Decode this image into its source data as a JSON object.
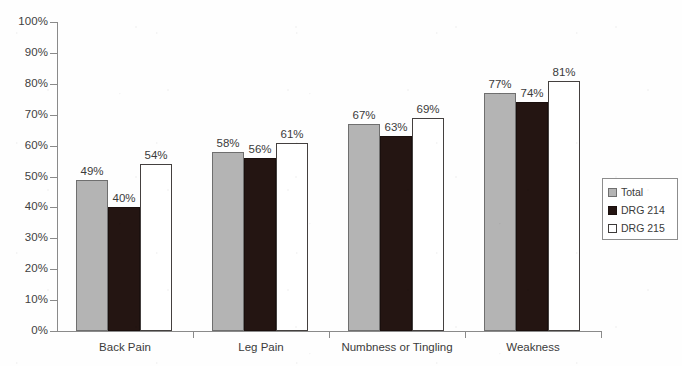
{
  "chart_data": {
    "type": "bar",
    "title": "",
    "subtitle": "",
    "xlabel": "",
    "ylabel": "",
    "ylim": [
      0,
      100
    ],
    "yticks": [
      "0%",
      "10%",
      "20%",
      "30%",
      "40%",
      "50%",
      "60%",
      "70%",
      "80%",
      "90%",
      "100%"
    ],
    "grid": false,
    "legend_position": "right",
    "categories": [
      "Back Pain",
      "Leg Pain",
      "Numbness or Tingling",
      "Weakness"
    ],
    "series": [
      {
        "name": "Total",
        "color": "#b4b4b4",
        "values": [
          49,
          58,
          67,
          77
        ],
        "labels": [
          "49%",
          "58%",
          "67%",
          "77%"
        ]
      },
      {
        "name": "DRG 214",
        "color": "#241512",
        "values": [
          40,
          56,
          63,
          74
        ],
        "labels": [
          "40%",
          "56%",
          "63%",
          "74%"
        ]
      },
      {
        "name": "DRG 215",
        "color": "#ffffff",
        "values": [
          54,
          61,
          69,
          81
        ],
        "labels": [
          "54%",
          "61%",
          "69%",
          "81%"
        ]
      }
    ]
  },
  "legend": {
    "items": [
      {
        "label": "Total",
        "swatch": "total"
      },
      {
        "label": "DRG 214",
        "swatch": "drg214"
      },
      {
        "label": "DRG 215",
        "swatch": "drg215"
      }
    ]
  },
  "axis": {
    "y_labels": [
      "100%",
      "90%",
      "80%",
      "70%",
      "60%",
      "50%",
      "40%",
      "30%",
      "20%",
      "10%",
      "0%"
    ]
  }
}
